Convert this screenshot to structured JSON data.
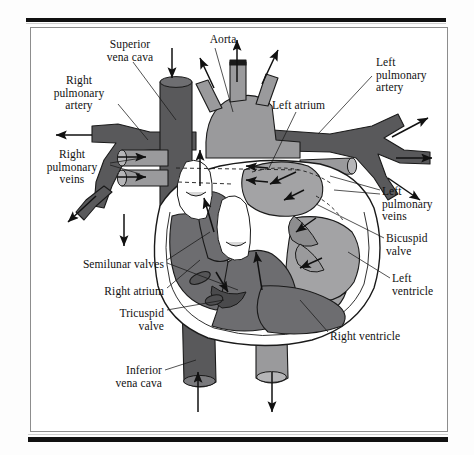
{
  "figure": {
    "type": "anatomical-diagram",
    "palette": {
      "deoxygenated_vessel": "#59595b",
      "oxygenated_vessel": "#9a9a9c",
      "right_chamber": "#6d6d70",
      "left_chamber": "#a3a3a5",
      "myocardium_outline": "#ffffff",
      "stroke": "#1a1a1a",
      "background": "#ffffff",
      "frame": "#8d8d8d",
      "bar": "#111111"
    }
  },
  "labels": [
    {
      "id": "superior-vena-cava",
      "text": "Superior\nvena cava",
      "x": 84,
      "y": 38,
      "w": 92,
      "align": "c"
    },
    {
      "id": "aorta",
      "text": "Aorta",
      "x": 192,
      "y": 33,
      "w": 62,
      "align": "c"
    },
    {
      "id": "left-pulmonary-artery",
      "text": "Left\npulmonary\nartery",
      "x": 376,
      "y": 56,
      "w": 78,
      "align": "l"
    },
    {
      "id": "right-pulmonary-artery",
      "text": "Right\npulmonary\nartery",
      "x": 36,
      "y": 74,
      "w": 86,
      "align": "c"
    },
    {
      "id": "left-atrium",
      "text": "Left atrium",
      "x": 272,
      "y": 99,
      "w": 80,
      "align": "l"
    },
    {
      "id": "right-pulmonary-veins",
      "text": "Right\npulmonary\nveins",
      "x": 30,
      "y": 148,
      "w": 84,
      "align": "c"
    },
    {
      "id": "left-pulmonary-veins",
      "text": "Left\npulmonary\nveins",
      "x": 382,
      "y": 185,
      "w": 76,
      "align": "l"
    },
    {
      "id": "bicuspid-valve",
      "text": "Bicuspid\nvalve",
      "x": 386,
      "y": 232,
      "w": 76,
      "align": "l"
    },
    {
      "id": "left-ventricle",
      "text": "Left\nventricle",
      "x": 392,
      "y": 272,
      "w": 72,
      "align": "l"
    },
    {
      "id": "semilunar-valves",
      "text": "Semilunar valves",
      "x": 54,
      "y": 258,
      "w": 110,
      "align": "r"
    },
    {
      "id": "right-atrium",
      "text": "Right atrium",
      "x": 72,
      "y": 285,
      "w": 92,
      "align": "r"
    },
    {
      "id": "tricuspid-valve",
      "text": "Tricuspid\nvalve",
      "x": 72,
      "y": 307,
      "w": 92,
      "align": "r"
    },
    {
      "id": "right-ventricle",
      "text": "Right ventricle",
      "x": 330,
      "y": 330,
      "w": 104,
      "align": "l"
    },
    {
      "id": "inferior-vena-cava",
      "text": "Inferior\nvena cava",
      "x": 70,
      "y": 364,
      "w": 92,
      "align": "r"
    }
  ],
  "leader_lines": [
    {
      "id": "leader-superior-vena-cava",
      "d": "M133,62 L176,120"
    },
    {
      "id": "leader-aorta",
      "d": "M215,48 L233,112"
    },
    {
      "id": "leader-left-pulmonary-artery",
      "d": "M372,76 L318,134"
    },
    {
      "id": "leader-right-pulmonary-artery",
      "d": "M118,104 L148,140"
    },
    {
      "id": "leader-left-atrium",
      "d": "M296,112 L268,170"
    },
    {
      "id": "leader-right-pulmonary-veins-a",
      "d": "M110,163 L142,158"
    },
    {
      "id": "leader-right-pulmonary-veins-b",
      "d": "M110,165 L140,174"
    },
    {
      "id": "leader-left-pulmonary-veins-a",
      "d": "M380,190 L330,176"
    },
    {
      "id": "leader-left-pulmonary-veins-b",
      "d": "M380,194 L334,190"
    },
    {
      "id": "leader-bicuspid-valve",
      "d": "M384,238 L316,204"
    },
    {
      "id": "leader-left-ventricle",
      "d": "M390,278 L348,252"
    },
    {
      "id": "leader-semilunar-a",
      "d": "M167,260 L210,232"
    },
    {
      "id": "leader-semilunar-b",
      "d": "M167,263 L238,290"
    },
    {
      "id": "leader-right-atrium",
      "d": "M167,288 L200,260"
    },
    {
      "id": "leader-tricuspid-valve",
      "d": "M167,310 L224,300"
    },
    {
      "id": "leader-right-ventricle",
      "d": "M328,332 L300,300"
    },
    {
      "id": "leader-inferior-vena-cava",
      "d": "M165,370 L196,360"
    }
  ],
  "flow_arrows": [
    {
      "id": "arrow-svc-in",
      "d": "M172,48 L172,78",
      "dir": "down"
    },
    {
      "id": "arrow-aorta-up",
      "d": "M237,82 L237,40",
      "dir": "up"
    },
    {
      "id": "arrow-brachio-left",
      "d": "M214,88 L200,58",
      "dir": "up-left"
    },
    {
      "id": "arrow-brachio-right",
      "d": "M262,84 L278,50",
      "dir": "up-right"
    },
    {
      "id": "arrow-rpa-out",
      "d": "M92,135 L56,135",
      "dir": "left"
    },
    {
      "id": "arrow-lpa-out-1",
      "d": "M392,137 L428,118",
      "dir": "up-right"
    },
    {
      "id": "arrow-lpa-out-2",
      "d": "M396,158 L432,158",
      "dir": "right"
    },
    {
      "id": "arrow-lpa-out-3",
      "d": "M388,178 L420,200",
      "dir": "down-right"
    },
    {
      "id": "arrow-rpv-in-1",
      "d": "M118,157 L146,157",
      "dir": "right"
    },
    {
      "id": "arrow-rpv-in-2",
      "d": "M118,177 L146,177",
      "dir": "right"
    },
    {
      "id": "arrow-rpa-lower-out",
      "d": "M96,196 L68,222",
      "dir": "down-left"
    },
    {
      "id": "arrow-svc-low",
      "d": "M124,214 L124,246",
      "dir": "down"
    },
    {
      "id": "arrow-ivc-in",
      "d": "M198,412 L198,372",
      "dir": "up"
    },
    {
      "id": "arrow-desc-aorta-out",
      "d": "M272,372 L272,412",
      "dir": "down"
    },
    {
      "id": "arrow-ra-to-rv",
      "d": "M216,272 L228,292",
      "dir": "down-right"
    },
    {
      "id": "arrow-rv-to-pa",
      "d": "M214,232 L204,198",
      "dir": "up"
    },
    {
      "id": "arrow-rv-up",
      "d": "M262,290 L256,252",
      "dir": "up"
    },
    {
      "id": "arrow-pulm-trunk-up",
      "d": "M200,186 L200,150",
      "dir": "up"
    },
    {
      "id": "arrow-la-to-lv",
      "d": "M296,172 L270,184",
      "dir": "left"
    },
    {
      "id": "arrow-la-in-1",
      "d": "M268,168 L246,166",
      "dir": "left"
    },
    {
      "id": "arrow-la-in-2",
      "d": "M268,182 L246,180",
      "dir": "left"
    },
    {
      "id": "arrow-lv-1",
      "d": "M304,190 L284,200",
      "dir": "down-left"
    },
    {
      "id": "arrow-lv-2",
      "d": "M316,218 L296,232",
      "dir": "down-left"
    },
    {
      "id": "arrow-lv-3",
      "d": "M322,258 L300,268",
      "dir": "down-left"
    }
  ]
}
